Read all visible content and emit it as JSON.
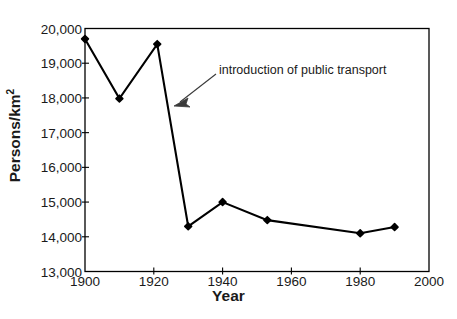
{
  "chart_data": {
    "type": "line",
    "title": "",
    "xlabel": "Year",
    "ylabel": "Persons/km2",
    "ylabel_display": "Persons/km",
    "ylabel_exponent": "2",
    "xlim": [
      1900,
      2000
    ],
    "ylim": [
      13000,
      20000
    ],
    "xticks": [
      1900,
      1920,
      1940,
      1960,
      1980,
      2000
    ],
    "xtick_labels": [
      "1900",
      "1920",
      "1940",
      "1960",
      "1980",
      "2000"
    ],
    "yticks": [
      13000,
      14000,
      15000,
      16000,
      17000,
      18000,
      19000,
      20000
    ],
    "ytick_labels": [
      "13,000",
      "14,000",
      "15,000",
      "16,000",
      "17,000",
      "18,000",
      "19,000",
      "20,000"
    ],
    "grid": false,
    "legend": null,
    "marker": "filled-diamond",
    "line_color": "#000000",
    "series": [
      {
        "name": "population density",
        "x": [
          1900,
          1910,
          1921,
          1930,
          1940,
          1953,
          1980,
          1990
        ],
        "values": [
          19700,
          17980,
          19550,
          14300,
          15000,
          14480,
          14100,
          14280
        ]
      }
    ],
    "annotations": [
      {
        "text": "introduction of public transport",
        "arrow_from_x": 1921,
        "arrow_from_y": 18650,
        "arrow_to_x": 1913,
        "arrow_to_y": 17800
      }
    ]
  },
  "axis": {
    "frame_color": "#000000"
  },
  "caption": {
    "text": ""
  }
}
